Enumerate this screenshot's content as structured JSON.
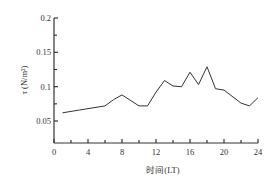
{
  "chart_data": {
    "type": "line",
    "title": "",
    "xlabel": "时间(LT)",
    "ylabel": "τ (N/m²)",
    "xlim": [
      0,
      24
    ],
    "ylim": [
      0.022,
      0.2
    ],
    "xticks": [
      0,
      4,
      8,
      12,
      16,
      20,
      24
    ],
    "xticks_minor": [
      2,
      6,
      10,
      14,
      18,
      22
    ],
    "xtick_labels": [
      "0",
      "4",
      "8",
      "12",
      "16",
      "20",
      "24"
    ],
    "yticks": [
      0.05,
      0.1,
      0.15,
      0.2
    ],
    "yticks_minor": [
      0.075,
      0.125,
      0.175
    ],
    "ytick_labels": [
      "0.05",
      "0.1",
      "0.15",
      "0.2"
    ],
    "grid": false,
    "legend": null,
    "series": [
      {
        "name": "τ",
        "color": "#333333",
        "x": [
          1,
          3,
          6,
          7,
          8,
          10,
          11,
          12,
          13,
          14,
          15,
          16,
          17,
          18,
          19,
          20,
          22,
          23,
          24
        ],
        "values": [
          0.062,
          0.066,
          0.072,
          0.081,
          0.088,
          0.072,
          0.072,
          0.092,
          0.109,
          0.101,
          0.1,
          0.121,
          0.103,
          0.129,
          0.097,
          0.095,
          0.076,
          0.072,
          0.084
        ]
      }
    ]
  },
  "axes": {
    "x_title": "时间(LT)",
    "y_title": "τ (N/m²)"
  }
}
